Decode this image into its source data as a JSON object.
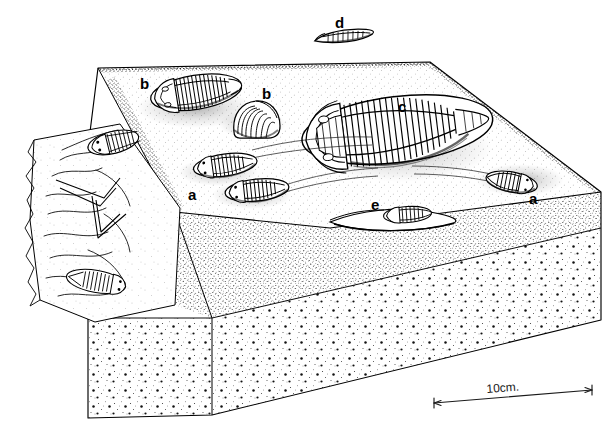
{
  "figure": {
    "type": "scientific-line-illustration",
    "medium": "pen-and-ink stipple drawing",
    "background_color": "#ffffff",
    "ink_color": "#000000",
    "width": 607,
    "height": 430
  },
  "scale_bar": {
    "label": "10cm.",
    "label_x": 487,
    "label_y": 388,
    "x1": 434,
    "y1": 403,
    "x2": 592,
    "y2": 390,
    "style": "double-headed-arrow"
  },
  "labels": [
    {
      "id": "label-d",
      "text": "d",
      "x": 335,
      "y": 17,
      "describes": "isolated-trilobite-lateral-view-above-block"
    },
    {
      "id": "label-b1",
      "text": "b",
      "x": 140,
      "y": 78,
      "describes": "outstretched-trilobite-on-bedding-surface"
    },
    {
      "id": "label-b2",
      "text": "b",
      "x": 262,
      "y": 88,
      "describes": "enrolled-trilobite-on-bedding-surface"
    },
    {
      "id": "label-c",
      "text": "c",
      "x": 398,
      "y": 101,
      "describes": "large-complete-trilobite-on-bedding-surface"
    },
    {
      "id": "label-a1",
      "text": "a",
      "x": 188,
      "y": 189,
      "describes": "small-trilobites-with-trace-trails"
    },
    {
      "id": "label-e",
      "text": "e",
      "x": 371,
      "y": 199,
      "describes": "trilobite-partly-buried-at-sediment-edge"
    },
    {
      "id": "label-a2",
      "text": "a",
      "x": 529,
      "y": 193,
      "describes": "trilobite-at-end-of-trace-trail-right-edge"
    }
  ],
  "specimens": [
    {
      "key": "d",
      "pose": "lateral / edge-on, detached above block",
      "position": "top-center"
    },
    {
      "key": "b",
      "pose": "outstretched, dorsal up",
      "position": "upper-left of bedding plane"
    },
    {
      "key": "b",
      "pose": "enrolled (curled)",
      "position": "upper-center of bedding plane"
    },
    {
      "key": "c",
      "pose": "large complete carapace, dorsal up",
      "position": "center-right of bedding plane"
    },
    {
      "key": "a",
      "pose": "two small trilobites at ends of crawling trails",
      "position": "center-left of bedding plane"
    },
    {
      "key": "a",
      "pose": "trilobite at end of crawling trail",
      "position": "right edge of bedding plane"
    },
    {
      "key": "e",
      "pose": "partly buried, sectioned at sediment surface",
      "position": "front edge of bedding plane"
    }
  ],
  "panels": [
    {
      "name": "bedding-plane-top",
      "description": "stippled upper surface of sediment block bearing trilobites a, b, b, c and traces"
    },
    {
      "name": "peeled-bedding-slab",
      "description": "left cut-away slab with burrow traces and two trilobites exposed"
    },
    {
      "name": "front-face",
      "description": "fine stippled cross-section of sediment below bedding plane"
    },
    {
      "name": "lower-unit",
      "description": "coarser granular stippled lower sediment unit"
    }
  ]
}
